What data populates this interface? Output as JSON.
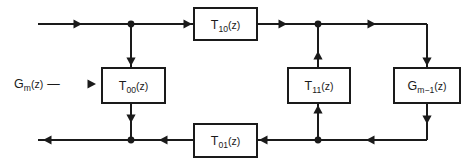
{
  "diagram": {
    "type": "signal-flow-graph",
    "colors": {
      "line": "#1a1a1a",
      "background": "#ffffff",
      "box_fill": "#ffffff"
    },
    "input_label": {
      "base": "G",
      "subscript": "m",
      "argument": "(z)",
      "arrow": "⟶",
      "text": "G m (z) ⟶"
    },
    "blocks": [
      {
        "id": "t10",
        "base": "T",
        "subscript": "10",
        "argument": "(z)",
        "text": "T10(z)",
        "x": 194,
        "y": 8,
        "w": 63,
        "h": 32
      },
      {
        "id": "t00",
        "base": "T",
        "subscript": "00",
        "argument": "(z)",
        "text": "T00(z)",
        "x": 102,
        "y": 68,
        "w": 63,
        "h": 35
      },
      {
        "id": "t11",
        "base": "T",
        "subscript": "11",
        "argument": "(z)",
        "text": "T11(z)",
        "x": 288,
        "y": 68,
        "w": 62,
        "h": 35
      },
      {
        "id": "gm1",
        "base": "G",
        "subscript": "m−1",
        "argument": "(z)",
        "text": "Gm−1(z)",
        "x": 394,
        "y": 68,
        "w": 66,
        "h": 35
      },
      {
        "id": "t01",
        "base": "T",
        "subscript": "01",
        "argument": "(z)",
        "text": "T01(z)",
        "x": 194,
        "y": 124,
        "w": 63,
        "h": 33
      }
    ],
    "nodes": [
      {
        "id": "top-left-junction",
        "x": 131,
        "y": 24,
        "r": 3.4
      },
      {
        "id": "top-right-junction",
        "x": 318,
        "y": 24,
        "r": 3.4
      },
      {
        "id": "bottom-left-junction",
        "x": 131,
        "y": 140,
        "r": 3.4
      },
      {
        "id": "bottom-right-junction",
        "x": 318,
        "y": 140,
        "r": 3.4
      }
    ],
    "wires": [
      {
        "id": "top-input-line",
        "points": "38,24 194,24"
      },
      {
        "id": "top-mid-line",
        "points": "257,24 427,24"
      },
      {
        "id": "right-down-line",
        "points": "427,24 427,68"
      },
      {
        "id": "t00-in-line",
        "points": "131,24 131,68"
      },
      {
        "id": "t00-out-line",
        "points": "131,103 131,140"
      },
      {
        "id": "t11-out-line",
        "points": "318,24 318,68"
      },
      {
        "id": "t11-in-line",
        "points": "318,140 318,103"
      },
      {
        "id": "gm1-out-line",
        "points": "427,103 427,140"
      },
      {
        "id": "bottom-right-line",
        "points": "427,140 257,140"
      },
      {
        "id": "bottom-left-line",
        "points": "194,140 38,140"
      }
    ],
    "arrows": [
      {
        "id": "arrow-top-input",
        "x": 82,
        "y": 24,
        "dir": "right"
      },
      {
        "id": "arrow-t10-in",
        "x": 192,
        "y": 24,
        "dir": "right"
      },
      {
        "id": "arrow-t10-out",
        "x": 287,
        "y": 24,
        "dir": "right"
      },
      {
        "id": "arrow-top-right",
        "x": 376,
        "y": 24,
        "dir": "right"
      },
      {
        "id": "arrow-t00-in",
        "x": 131,
        "y": 66,
        "dir": "down"
      },
      {
        "id": "arrow-t00-out",
        "x": 131,
        "y": 123,
        "dir": "down"
      },
      {
        "id": "arrow-gm1-in",
        "x": 427,
        "y": 66,
        "dir": "down"
      },
      {
        "id": "arrow-gm1-out",
        "x": 427,
        "y": 124,
        "dir": "down"
      },
      {
        "id": "arrow-t11-out",
        "x": 318,
        "y": 51,
        "dir": "up"
      },
      {
        "id": "arrow-t11-in",
        "x": 318,
        "y": 105,
        "dir": "up"
      },
      {
        "id": "arrow-bottom-right",
        "x": 366,
        "y": 140,
        "dir": "left"
      },
      {
        "id": "arrow-t01-in",
        "x": 259,
        "y": 140,
        "dir": "left"
      },
      {
        "id": "arrow-t01-out",
        "x": 159,
        "y": 140,
        "dir": "left"
      },
      {
        "id": "arrow-bottom-output",
        "x": 43,
        "y": 140,
        "dir": "left"
      },
      {
        "id": "arrow-input-label",
        "x": 96,
        "y": 84,
        "dir": "right"
      }
    ]
  }
}
